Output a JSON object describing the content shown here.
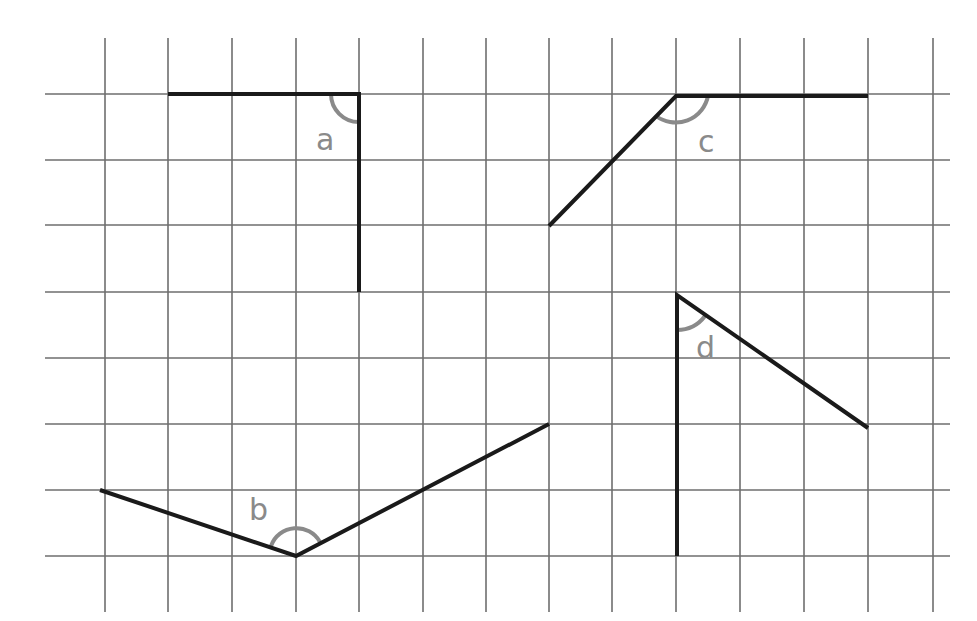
{
  "diagram": {
    "grid": {
      "x_lines": [
        105,
        168,
        232,
        296,
        359,
        423,
        486,
        549,
        612,
        676,
        740,
        804,
        868,
        933
      ],
      "y_lines": [
        94,
        160,
        225,
        292,
        358,
        424,
        490,
        556
      ],
      "h_extent": [
        45,
        950
      ],
      "v_extent": [
        38,
        612
      ],
      "color": "#6e6e6e"
    },
    "line_color": "#1a1a1a",
    "arc_color": "#8a8a8a",
    "angles": [
      {
        "label": "a",
        "vertex": [
          359,
          94
        ],
        "arms": [
          [
            168,
            94
          ],
          [
            359,
            292
          ]
        ],
        "arc": "M331 94 A28 28 0 0 0 359 122",
        "label_pos": [
          316,
          150
        ]
      },
      {
        "label": "b",
        "vertex": [
          296,
          556
        ],
        "arms": [
          [
            100,
            490
          ],
          [
            549,
            424
          ]
        ],
        "arc": "M271 546 A27 27 0 0 1 320 542",
        "label_pos": [
          249,
          520
        ]
      },
      {
        "label": "c",
        "vertex": [
          676,
          96
        ],
        "arms": [
          [
            549,
            226
          ],
          [
            868,
            96
          ]
        ],
        "arc": "M656 116 A33 33 0 0 0 708 96",
        "label_pos": [
          698,
          152
        ]
      },
      {
        "label": "d",
        "vertex": [
          677,
          295
        ],
        "arms": [
          [
            677,
            556
          ],
          [
            868,
            428
          ]
        ],
        "arc": "M677 330 A35 35 0 0 0 705 316",
        "label_pos": [
          696,
          358
        ]
      }
    ]
  }
}
